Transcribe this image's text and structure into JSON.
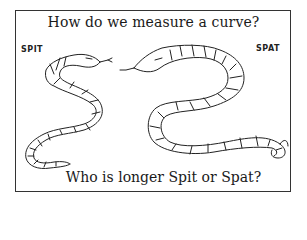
{
  "title": "How do we measure a curve?",
  "caption": "Who is longer Spit or Spat?",
  "snakes": [
    {
      "name": "SPIT",
      "side": "left",
      "icon": "snake-icon"
    },
    {
      "name": "SPAT",
      "side": "right",
      "icon": "snake-icon"
    }
  ],
  "colors": {
    "ink": "#222222",
    "frame": "#333333",
    "background": "#ffffff"
  }
}
